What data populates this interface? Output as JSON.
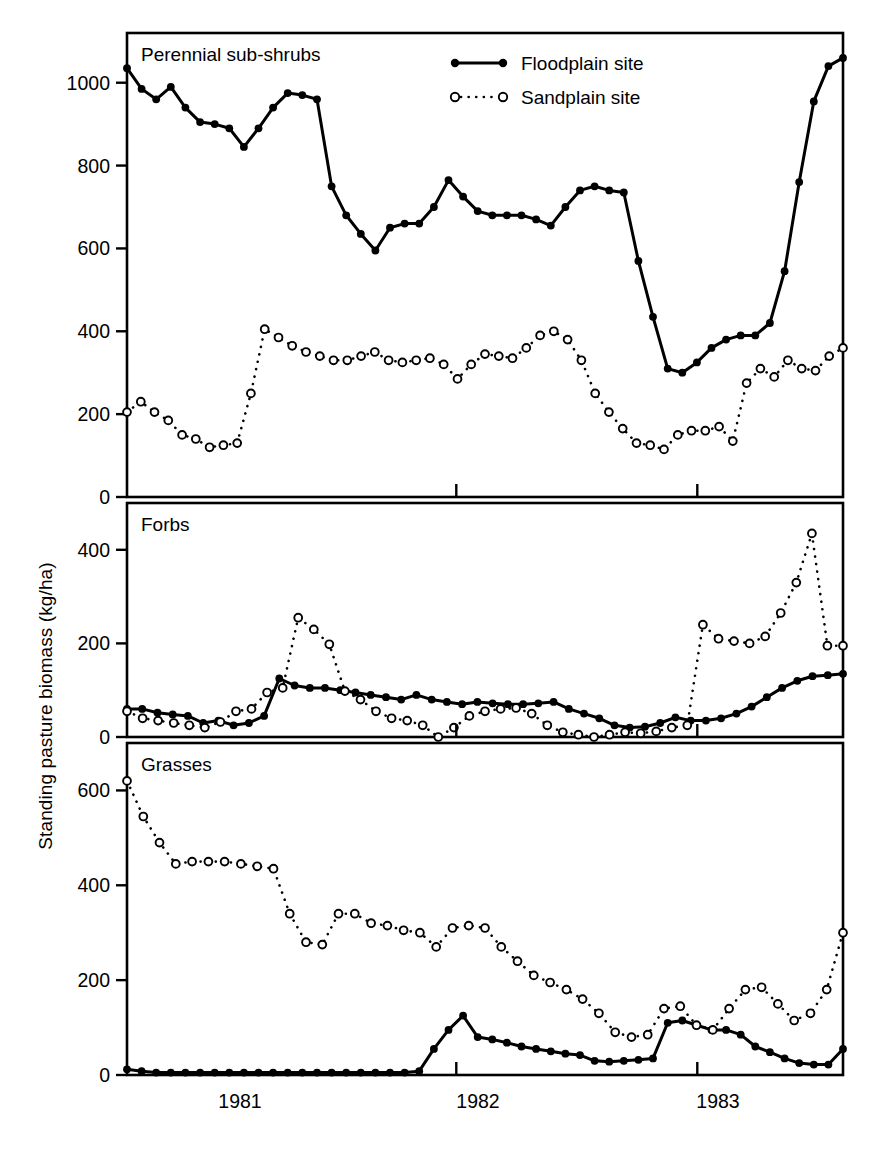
{
  "figure": {
    "ylabel": "Standing pasture biomass (kg/ha)",
    "xtick_labels": [
      "1981",
      "1982",
      "1983"
    ],
    "legend": [
      {
        "label": "Floodplain site",
        "marker": "filled-circle",
        "line": "solid",
        "color": "#000000"
      },
      {
        "label": "Sandplain site",
        "marker": "open-circle",
        "line": "dotted",
        "color": "#000000"
      }
    ]
  },
  "chart_data": [
    {
      "type": "line",
      "title": "Perennial sub-shrubs",
      "xlabel": "",
      "ylabel": "Standing pasture biomass (kg/ha)",
      "ylim": [
        0,
        1120
      ],
      "yticks": [
        0,
        200,
        400,
        600,
        800,
        1000
      ],
      "xlim": [
        0,
        46
      ],
      "xticks_years": {
        "1981": 12,
        "1982": 25,
        "1983": 38
      },
      "grid": false,
      "legend_position": "top-right",
      "series": [
        {
          "name": "Floodplain site",
          "marker": "filled-circle",
          "line": "solid",
          "x": [
            0,
            1,
            2,
            3,
            4,
            5,
            6,
            7,
            8,
            9,
            10,
            11,
            12,
            13,
            14,
            15,
            16,
            17,
            18,
            19,
            20,
            21,
            22,
            23,
            24,
            25,
            26,
            27,
            28,
            29,
            30,
            31,
            32,
            33,
            34,
            35,
            36,
            37,
            38,
            39,
            40,
            41,
            42,
            43,
            44,
            45
          ],
          "values": [
            1035,
            985,
            960,
            990,
            940,
            905,
            900,
            890,
            845,
            890,
            940,
            975,
            970,
            960,
            750,
            680,
            635,
            595,
            650,
            660,
            660,
            700,
            765,
            725,
            690,
            680,
            680,
            680,
            670,
            655,
            700,
            740,
            750,
            740,
            735,
            570,
            435,
            310,
            300,
            325,
            360,
            380,
            390,
            390,
            420,
            545,
            760,
            955,
            1040,
            1060
          ]
        },
        {
          "name": "Sandplain site",
          "marker": "open-circle",
          "line": "dotted",
          "x": [
            0,
            1,
            2,
            3,
            4,
            5,
            6,
            7,
            8,
            9,
            10,
            11,
            12,
            13,
            14,
            15,
            16,
            17,
            18,
            19,
            20,
            21,
            22,
            23,
            24,
            25,
            26,
            27,
            28,
            29,
            30,
            31,
            32,
            33,
            34,
            35,
            36,
            37,
            38,
            39,
            40,
            41,
            42,
            43,
            44,
            45
          ],
          "values": [
            205,
            230,
            205,
            185,
            150,
            140,
            120,
            125,
            130,
            250,
            405,
            385,
            365,
            350,
            340,
            330,
            330,
            340,
            350,
            330,
            325,
            330,
            335,
            320,
            285,
            320,
            345,
            340,
            335,
            360,
            390,
            400,
            380,
            330,
            250,
            205,
            165,
            130,
            125,
            115,
            150,
            160,
            160,
            170,
            135,
            275,
            310,
            290,
            330,
            310,
            305,
            340,
            360
          ]
        }
      ]
    },
    {
      "type": "line",
      "title": "Forbs",
      "xlabel": "",
      "ylabel": "Standing pasture biomass (kg/ha)",
      "ylim": [
        0,
        500
      ],
      "yticks": [
        0,
        200,
        400
      ],
      "xlim": [
        0,
        46
      ],
      "grid": false,
      "series": [
        {
          "name": "Floodplain site",
          "marker": "filled-circle",
          "line": "solid",
          "values": [
            60,
            60,
            52,
            48,
            45,
            30,
            35,
            25,
            30,
            45,
            125,
            110,
            105,
            105,
            100,
            95,
            90,
            85,
            80,
            90,
            80,
            75,
            70,
            75,
            72,
            70,
            70,
            72,
            75,
            60,
            50,
            40,
            25,
            20,
            22,
            30,
            42,
            35,
            35,
            40,
            50,
            65,
            85,
            105,
            120,
            130,
            132,
            135
          ]
        },
        {
          "name": "Sandplain site",
          "marker": "open-circle",
          "line": "dotted",
          "values": [
            55,
            40,
            35,
            30,
            25,
            20,
            32,
            55,
            60,
            95,
            105,
            255,
            230,
            198,
            98,
            80,
            55,
            40,
            35,
            25,
            0,
            20,
            45,
            55,
            60,
            62,
            50,
            25,
            10,
            5,
            0,
            5,
            10,
            8,
            12,
            20,
            25,
            240,
            210,
            205,
            200,
            215,
            265,
            330,
            435,
            195,
            195
          ]
        }
      ]
    },
    {
      "type": "line",
      "title": "Grasses",
      "xlabel": "",
      "ylabel": "Standing pasture biomass (kg/ha)",
      "ylim": [
        0,
        700
      ],
      "yticks": [
        0,
        200,
        400,
        600
      ],
      "xlim": [
        0,
        46
      ],
      "grid": false,
      "series": [
        {
          "name": "Floodplain site",
          "marker": "filled-circle",
          "line": "solid",
          "values": [
            12,
            8,
            5,
            5,
            5,
            5,
            5,
            5,
            5,
            5,
            5,
            5,
            5,
            5,
            5,
            5,
            5,
            5,
            5,
            5,
            8,
            55,
            95,
            125,
            80,
            75,
            68,
            60,
            55,
            50,
            45,
            42,
            30,
            28,
            30,
            32,
            35,
            110,
            115,
            105,
            95,
            95,
            85,
            60,
            48,
            35,
            25,
            22,
            22,
            55
          ]
        },
        {
          "name": "Sandplain site",
          "marker": "open-circle",
          "line": "dotted",
          "values": [
            620,
            545,
            490,
            445,
            450,
            450,
            450,
            445,
            440,
            435,
            340,
            280,
            275,
            340,
            340,
            320,
            315,
            305,
            300,
            270,
            310,
            315,
            310,
            270,
            240,
            210,
            195,
            180,
            160,
            130,
            90,
            80,
            85,
            140,
            145,
            105,
            95,
            140,
            180,
            185,
            150,
            115,
            130,
            180,
            300
          ]
        }
      ]
    }
  ]
}
